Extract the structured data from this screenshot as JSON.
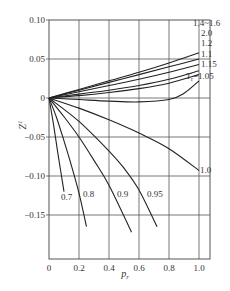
{
  "chart_data": {
    "type": "line",
    "title": "",
    "xlabel": "p_r",
    "ylabel": "Z^1",
    "xlim": [
      0,
      1.07
    ],
    "ylim": [
      -0.205,
      0.1
    ],
    "grid": true,
    "x_ticks": [
      0,
      0.2,
      0.4,
      0.6,
      0.8,
      1.0
    ],
    "x_tick_labels": [
      "0",
      "0.2",
      "0.4",
      "0.6",
      "0.8",
      "1.0"
    ],
    "y_ticks": [
      0.1,
      0.05,
      0,
      -0.05,
      -0.1,
      -0.15
    ],
    "y_tick_labels": [
      "0.10",
      "0.05",
      "0",
      "−0.05",
      "−0.10",
      "−0.15"
    ],
    "series": [
      {
        "name": "1.4~1.6",
        "label": "1.4~1.6",
        "x": [
          0,
          0.2,
          0.4,
          0.6,
          0.8,
          1.0
        ],
        "y": [
          0,
          0.011,
          0.022,
          0.033,
          0.045,
          0.058
        ]
      },
      {
        "name": "2.0",
        "label": "2.0",
        "x": [
          0,
          0.2,
          0.4,
          0.6,
          0.8,
          1.0
        ],
        "y": [
          0,
          0.01,
          0.02,
          0.03,
          0.04,
          0.05
        ]
      },
      {
        "name": "1.2",
        "label": "1.2",
        "x": [
          0,
          0.2,
          0.4,
          0.6,
          0.8,
          1.0
        ],
        "y": [
          0,
          0.008,
          0.016,
          0.024,
          0.033,
          0.043
        ]
      },
      {
        "name": "1.1",
        "label": "1.1",
        "x": [
          0,
          0.2,
          0.4,
          0.6,
          0.8,
          1.0
        ],
        "y": [
          0,
          0.005,
          0.01,
          0.016,
          0.024,
          0.035
        ]
      },
      {
        "name": "1.15",
        "label": "1.15",
        "x": [
          0,
          0.2,
          0.4,
          0.6,
          0.8,
          1.0
        ],
        "y": [
          0,
          0.003,
          0.007,
          0.012,
          0.019,
          0.03
        ]
      },
      {
        "name": "1.05",
        "label": "T_r=1.05",
        "x": [
          0,
          0.2,
          0.4,
          0.6,
          0.8,
          0.9,
          1.0
        ],
        "y": [
          0,
          -0.002,
          -0.004,
          -0.005,
          -0.002,
          0.006,
          0.022
        ]
      },
      {
        "name": "1.0",
        "label": "1.0",
        "x": [
          0,
          0.2,
          0.4,
          0.6,
          0.8,
          1.0
        ],
        "y": [
          0,
          -0.013,
          -0.028,
          -0.045,
          -0.065,
          -0.093
        ]
      },
      {
        "name": "0.95",
        "label": "0.95",
        "x": [
          0,
          0.2,
          0.4,
          0.5,
          0.6,
          0.72
        ],
        "y": [
          0,
          -0.03,
          -0.068,
          -0.09,
          -0.118,
          -0.165
        ]
      },
      {
        "name": "0.9",
        "label": "0.9",
        "x": [
          0,
          0.1,
          0.2,
          0.3,
          0.4,
          0.55
        ],
        "y": [
          0,
          -0.024,
          -0.05,
          -0.08,
          -0.112,
          -0.172
        ]
      },
      {
        "name": "0.8",
        "label": "0.8",
        "x": [
          0,
          0.05,
          0.1,
          0.15,
          0.2,
          0.25
        ],
        "y": [
          0,
          -0.025,
          -0.055,
          -0.087,
          -0.122,
          -0.165
        ]
      },
      {
        "name": "0.7",
        "label": "0.7",
        "x": [
          0,
          0.03,
          0.06,
          0.1
        ],
        "y": [
          0,
          -0.034,
          -0.072,
          -0.12
        ]
      }
    ]
  }
}
